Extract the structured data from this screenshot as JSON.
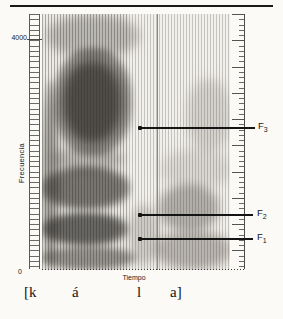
{
  "figure": {
    "y_axis": {
      "label": "Frecuencia",
      "tick_top": "4000",
      "tick_bottom": "0"
    },
    "x_axis": {
      "label": "Tiempo"
    },
    "formant_labels": {
      "f3": {
        "base": "F",
        "sub": "3"
      },
      "f2": {
        "base": "F",
        "sub": "2"
      },
      "f1": {
        "base": "F",
        "sub": "1"
      }
    },
    "transcription": {
      "seg1": "[k",
      "seg2": "á",
      "seg3": "l",
      "seg4": "a]"
    }
  },
  "chart_data": {
    "type": "heatmap",
    "xlabel": "Tiempo",
    "ylabel": "Frecuencia",
    "ylim_hz": [
      0,
      4400
    ],
    "y_ticks_hz": [
      0,
      4000
    ],
    "grid": false,
    "segments": [
      "[k",
      "á",
      "l",
      "a]"
    ],
    "annotations": [
      {
        "label": "F3",
        "freq_hz_est": 2450
      },
      {
        "label": "F2",
        "freq_hz_est": 950
      },
      {
        "label": "F1",
        "freq_hz_est": 550
      }
    ]
  },
  "colors": {
    "ink": "#1b1b1b",
    "ruler": "#5a5a56",
    "boundary_line": "#8b8b85",
    "spectrogram_bg": "#edebe6",
    "page_bg": "#fbfaf7"
  }
}
